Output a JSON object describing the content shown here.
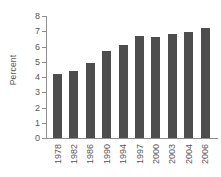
{
  "chart_data": {
    "type": "bar",
    "title": "",
    "xlabel": "",
    "ylabel": "Percent",
    "ylim": [
      0,
      8
    ],
    "ytick_labels": [
      "8",
      "7",
      "6",
      "5",
      "4",
      "3",
      "2",
      "1",
      "0"
    ],
    "yticks": [
      8,
      7,
      6,
      5,
      4,
      3,
      2,
      1,
      0
    ],
    "grid": false,
    "legend": null,
    "categories": [
      "1978",
      "1982",
      "1986",
      "1990",
      "1994",
      "1997",
      "2000",
      "2003",
      "2004",
      "2006"
    ],
    "values": [
      4.2,
      4.4,
      4.9,
      5.7,
      6.1,
      6.7,
      6.6,
      6.8,
      6.95,
      7.2
    ],
    "bar_color": "#4d4d4d",
    "axis_color": "#8d8d8d",
    "text_color": "#585858",
    "background": "#ffffff"
  }
}
